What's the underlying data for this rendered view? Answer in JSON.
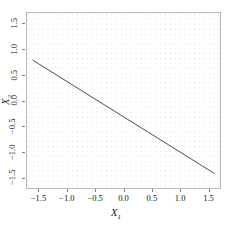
{
  "chart_data": {
    "type": "line",
    "title": "",
    "xlabel": "X1",
    "ylabel": "X2",
    "xlabel_base": "X",
    "xlabel_sub": "1",
    "ylabel_base": "X",
    "ylabel_sub": "2",
    "xlim": [
      -1.72,
      1.72
    ],
    "ylim": [
      -1.72,
      1.72
    ],
    "xticks": [
      -1.5,
      -1.0,
      -0.5,
      0.0,
      0.5,
      1.0,
      1.5
    ],
    "xticklabels": [
      "−1.5",
      "−1.0",
      "−0.5",
      "0.0",
      "0.5",
      "1.0",
      "1.5"
    ],
    "yticks": [
      -1.5,
      -1.0,
      -0.5,
      0.0,
      0.5,
      1.0,
      1.5
    ],
    "yticklabels": [
      "−1.5",
      "−1.0",
      "−0.5",
      "0.0",
      "0.5",
      "1.0",
      "1.5"
    ],
    "grid": "dotted",
    "grid_color": "#dddddd",
    "grid_spacing": 0.086,
    "legend": "none",
    "series": [
      {
        "name": "decision-boundary",
        "kind": "line",
        "color": "#4d4d4d",
        "linewidth": 1,
        "slope": -0.6875,
        "intercept": -0.32,
        "x": [
          -1.62,
          1.62
        ],
        "y": [
          0.794,
          -1.434
        ],
        "points": [
          {
            "x": -1.62,
            "y": 0.794
          },
          {
            "x": -1.0,
            "y": 0.368
          },
          {
            "x": -0.5,
            "y": 0.024
          },
          {
            "x": 0.0,
            "y": -0.32
          },
          {
            "x": 0.5,
            "y": -0.664
          },
          {
            "x": 1.0,
            "y": -1.008
          },
          {
            "x": 1.62,
            "y": -1.434
          }
        ]
      }
    ],
    "panel_border_color": "#b9b9b9",
    "background": "#ffffff"
  },
  "figure": {
    "x_axis_title_label": "X",
    "x_axis_title_subscript": "1",
    "y_axis_title_label": "X",
    "y_axis_title_subscript": "2"
  }
}
